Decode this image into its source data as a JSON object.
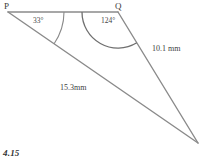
{
  "figure": {
    "type": "geometry-triangle-diagram",
    "number": "4.15",
    "background_color": "#ffffff",
    "line_color": "#8a8a8a",
    "text_color": "#2b2b2b",
    "vertices": [
      {
        "name": "P",
        "label": "P",
        "x": 8,
        "y": 12
      },
      {
        "name": "Q",
        "label": "Q",
        "x": 118,
        "y": 12
      },
      {
        "name": "R",
        "label": "",
        "x": 198,
        "y": 143
      }
    ],
    "angles": [
      {
        "at": "P",
        "label": "33°",
        "value": 33,
        "arc_radius": 56
      },
      {
        "at": "Q",
        "label": "124°",
        "value": 124,
        "arc_radius": 36
      }
    ],
    "sides": [
      {
        "from": "Q",
        "to": "R",
        "label": "10.1 mm",
        "value": 10.1,
        "unit": "mm"
      },
      {
        "from": "P",
        "to": "R",
        "label": "15.3mm",
        "value": 15.3,
        "unit": "mm"
      },
      {
        "from": "P",
        "to": "Q",
        "label": ""
      }
    ]
  }
}
